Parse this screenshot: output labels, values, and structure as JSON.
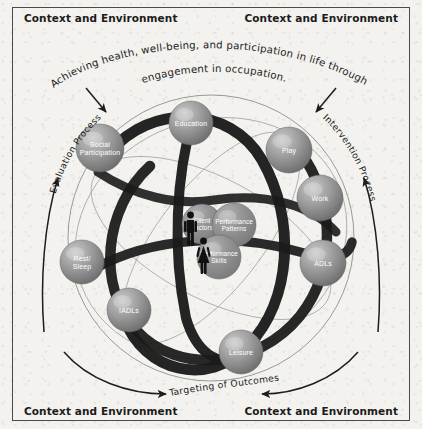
{
  "diagram": {
    "title_arc_line1": "Achieving health, well-being, and participation in life through",
    "title_arc_line2": "engagement in occupation.",
    "context_labels": {
      "top_left": "Context and Environment",
      "top_right": "Context and Environment",
      "bottom_left": "Context and Environment",
      "bottom_right": "Context and Environment"
    },
    "process_left": "Evaluation Process",
    "process_right": "Intervention Process",
    "outcome_label": "Targeting of Outcomes",
    "colors": {
      "background": "#f3f2ee",
      "frame": "#4a4a4a",
      "sphere_light": "#b8b8b8",
      "sphere_dark": "#6e6e6e",
      "core_sphere": "#8e8e8e",
      "band_dark": "#1c1c1c",
      "orbit_line": "#8a8a8a",
      "figure": "#111111",
      "text_dark": "#1b1b1b",
      "text_white": "#ffffff"
    },
    "occupation_spheres": [
      {
        "id": "education",
        "label": "Education",
        "label_lines": [
          "Education"
        ],
        "cx": 191,
        "cy": 123,
        "r": 22
      },
      {
        "id": "social-participation",
        "label": "Social Participation",
        "label_lines": [
          "Social",
          "Participation"
        ],
        "cx": 100,
        "cy": 148,
        "r": 24
      },
      {
        "id": "play",
        "label": "Play",
        "label_lines": [
          "Play"
        ],
        "cx": 289,
        "cy": 150,
        "r": 23
      },
      {
        "id": "work",
        "label": "Work",
        "label_lines": [
          "Work"
        ],
        "cx": 320,
        "cy": 198,
        "r": 23
      },
      {
        "id": "adls",
        "label": "ADLs",
        "label_lines": [
          "ADLs"
        ],
        "cx": 323,
        "cy": 263,
        "r": 23
      },
      {
        "id": "rest-sleep",
        "label": "Rest/Sleep",
        "label_lines": [
          "Rest/",
          "Sleep"
        ],
        "cx": 82,
        "cy": 262,
        "r": 22
      },
      {
        "id": "iadls",
        "label": "IADLs",
        "label_lines": [
          "IADLs"
        ],
        "cx": 129,
        "cy": 310,
        "r": 22
      },
      {
        "id": "leisure",
        "label": "Leisure",
        "label_lines": [
          "Leisure"
        ],
        "cx": 241,
        "cy": 352,
        "r": 22
      }
    ],
    "core_spheres": [
      {
        "id": "client-factors",
        "label": "Client Factors",
        "label_lines": [
          "Client",
          "Factors"
        ],
        "cx": 202,
        "cy": 224,
        "r": 20
      },
      {
        "id": "performance-patterns",
        "label": "Performance Patterns",
        "label_lines": [
          "Performance",
          "Patterns"
        ],
        "cx": 234,
        "cy": 225,
        "r": 22
      },
      {
        "id": "performance-skills",
        "label": "Performance Skills",
        "label_lines": [
          "Performance",
          "Skills"
        ],
        "cx": 219,
        "cy": 257,
        "r": 22
      }
    ],
    "figures": [
      {
        "id": "male-figure",
        "label": "male person icon",
        "x": 190,
        "y": 214
      },
      {
        "id": "female-figure",
        "label": "female person icon",
        "x": 203,
        "y": 240
      }
    ]
  }
}
